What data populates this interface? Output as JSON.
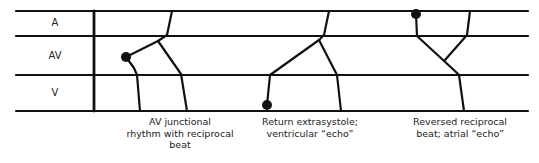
{
  "rows": [
    {
      "label": "A"
    },
    {
      "label": "AV"
    },
    {
      "label": "V"
    }
  ],
  "beats": [
    {
      "name": "av-junctional-reciprocal",
      "caption_lines": [
        "AV junctional",
        "rhythm with reciprocal",
        "beat"
      ]
    },
    {
      "name": "return-extrasystole",
      "caption_lines": [
        "Return extrasystole;",
        "ventricular “echo”"
      ]
    },
    {
      "name": "reversed-reciprocal",
      "caption_lines": [
        "Reversed reciprocal",
        "beat; atrial “echo”"
      ]
    }
  ],
  "colors": {
    "ink": "#111111"
  }
}
